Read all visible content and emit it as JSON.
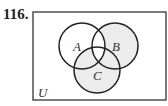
{
  "problem": {
    "number": "116."
  },
  "diagram": {
    "type": "venn-3",
    "universe_label": "U",
    "sets": [
      {
        "id": "A",
        "label": "A"
      },
      {
        "id": "B",
        "label": "B"
      },
      {
        "id": "C",
        "label": "C"
      }
    ],
    "shaded_regions": [
      "B only",
      "C only",
      "B and C not A",
      "A and C not B"
    ],
    "shade_color": "#ececec",
    "line_color": "#222222"
  }
}
